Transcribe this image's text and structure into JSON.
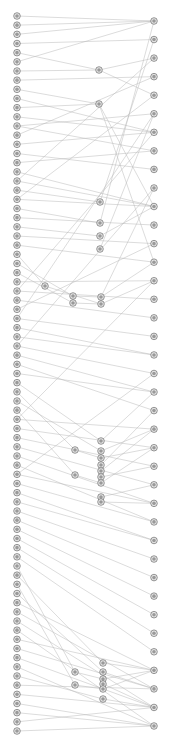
{
  "diagram": {
    "type": "layered-graph",
    "width": 172,
    "height": 753,
    "colors": {
      "edge": "#b8b8b8",
      "node_fill": "#e8e8e8",
      "node_stroke": "#555555",
      "node_core": "#9a9a9a"
    },
    "columns": {
      "left": {
        "x": 17,
        "y_start": 16,
        "y_end": 731,
        "count": 79
      },
      "right": {
        "x": 154,
        "y_start": 21,
        "y_end": 726,
        "count": 39
      }
    },
    "middle_nodes": [
      {
        "id": "m1",
        "x": 99,
        "y": 70
      },
      {
        "id": "m2",
        "x": 99,
        "y": 104
      },
      {
        "id": "m3",
        "x": 100,
        "y": 202
      },
      {
        "id": "m4",
        "x": 100,
        "y": 223
      },
      {
        "id": "m5",
        "x": 100,
        "y": 236
      },
      {
        "id": "m6",
        "x": 100,
        "y": 249
      },
      {
        "id": "m7",
        "x": 45,
        "y": 286
      },
      {
        "id": "m8",
        "x": 73,
        "y": 296
      },
      {
        "id": "m9",
        "x": 73,
        "y": 303
      },
      {
        "id": "m10",
        "x": 101,
        "y": 297
      },
      {
        "id": "m11",
        "x": 101,
        "y": 304
      },
      {
        "id": "m12",
        "x": 75,
        "y": 450
      },
      {
        "id": "m13",
        "x": 75,
        "y": 475
      },
      {
        "id": "m14",
        "x": 101,
        "y": 441
      },
      {
        "id": "m15",
        "x": 101,
        "y": 451
      },
      {
        "id": "m16",
        "x": 101,
        "y": 458
      },
      {
        "id": "m17",
        "x": 101,
        "y": 465
      },
      {
        "id": "m18",
        "x": 101,
        "y": 471
      },
      {
        "id": "m19",
        "x": 101,
        "y": 477
      },
      {
        "id": "m20",
        "x": 101,
        "y": 483
      },
      {
        "id": "m21",
        "x": 101,
        "y": 497
      },
      {
        "id": "m22",
        "x": 101,
        "y": 502
      },
      {
        "id": "m23",
        "x": 75,
        "y": 672
      },
      {
        "id": "m24",
        "x": 75,
        "y": 685
      },
      {
        "id": "m25",
        "x": 103,
        "y": 663
      },
      {
        "id": "m26",
        "x": 103,
        "y": 672
      },
      {
        "id": "m27",
        "x": 103,
        "y": 679
      },
      {
        "id": "m28",
        "x": 103,
        "y": 684
      },
      {
        "id": "m29",
        "x": 103,
        "y": 689
      },
      {
        "id": "m30",
        "x": 103,
        "y": 699
      }
    ],
    "edges": [
      [
        "L0",
        "R0"
      ],
      [
        "L1",
        "R0"
      ],
      [
        "L2",
        "R0"
      ],
      [
        "L3",
        "R1"
      ],
      [
        "L4",
        "m1"
      ],
      [
        "L5",
        "R0"
      ],
      [
        "L6",
        "m1"
      ],
      [
        "L7",
        "R3"
      ],
      [
        "L8",
        "m2"
      ],
      [
        "L9",
        "R6"
      ],
      [
        "L10",
        "m2"
      ],
      [
        "L11",
        "R6"
      ],
      [
        "L12",
        "R5"
      ],
      [
        "L13",
        "R3"
      ],
      [
        "L14",
        "R6"
      ],
      [
        "L15",
        "R8"
      ],
      [
        "L16",
        "R7"
      ],
      [
        "L17",
        "R10"
      ],
      [
        "L18",
        "R10"
      ],
      [
        "L19",
        "m3"
      ],
      [
        "L20",
        "R10"
      ],
      [
        "L21",
        "m4"
      ],
      [
        "L22",
        "R11"
      ],
      [
        "L23",
        "m5"
      ],
      [
        "L24",
        "R12"
      ],
      [
        "L25",
        "R13"
      ],
      [
        "L26",
        "m7"
      ],
      [
        "L27",
        "m8"
      ],
      [
        "L28",
        "m9"
      ],
      [
        "L29",
        "R14"
      ],
      [
        "L30",
        "R15"
      ],
      [
        "L31",
        "R16"
      ],
      [
        "L32",
        "R12"
      ],
      [
        "L33",
        "R17"
      ],
      [
        "L34",
        "R18"
      ],
      [
        "L35",
        "R18"
      ],
      [
        "L36",
        "R19"
      ],
      [
        "L37",
        "R20"
      ],
      [
        "L38",
        "R21"
      ],
      [
        "L39",
        "R20"
      ],
      [
        "L40",
        "m14"
      ],
      [
        "L41",
        "m12"
      ],
      [
        "L42",
        "m15"
      ],
      [
        "L43",
        "m13"
      ],
      [
        "L44",
        "R22"
      ],
      [
        "L45",
        "R23"
      ],
      [
        "L46",
        "R24"
      ],
      [
        "L47",
        "R25"
      ],
      [
        "L48",
        "R26"
      ],
      [
        "L49",
        "R27"
      ],
      [
        "L50",
        "R26"
      ],
      [
        "L51",
        "R27"
      ],
      [
        "L52",
        "R28"
      ],
      [
        "L53",
        "R28"
      ],
      [
        "L54",
        "R29"
      ],
      [
        "L55",
        "R30"
      ],
      [
        "L56",
        "R31"
      ],
      [
        "L57",
        "R32"
      ],
      [
        "L58",
        "R33"
      ],
      [
        "L59",
        "R34"
      ],
      [
        "L60",
        "m23"
      ],
      [
        "L61",
        "m25"
      ],
      [
        "L62",
        "m24"
      ],
      [
        "L63",
        "m26"
      ],
      [
        "L64",
        "R35"
      ],
      [
        "L65",
        "R36"
      ],
      [
        "L66",
        "R37"
      ],
      [
        "L67",
        "R38"
      ],
      [
        "L68",
        "R35"
      ],
      [
        "L69",
        "R36"
      ],
      [
        "L70",
        "R37"
      ],
      [
        "L71",
        "R38"
      ],
      [
        "L72",
        "m30"
      ],
      [
        "L73",
        "R36"
      ],
      [
        "L74",
        "R37"
      ],
      [
        "L75",
        "R38"
      ],
      [
        "L76",
        "R38"
      ],
      [
        "L77",
        "R37"
      ],
      [
        "L78",
        "R38"
      ],
      [
        "m1",
        "R2"
      ],
      [
        "m1",
        "R4"
      ],
      [
        "m2",
        "R10"
      ],
      [
        "m2",
        "R13"
      ],
      [
        "m3",
        "R1"
      ],
      [
        "m4",
        "R0"
      ],
      [
        "m5",
        "R10"
      ],
      [
        "m6",
        "R5"
      ],
      [
        "m7",
        "m11"
      ],
      [
        "m8",
        "m10"
      ],
      [
        "m9",
        "m11"
      ],
      [
        "m10",
        "R13"
      ],
      [
        "m11",
        "R14"
      ],
      [
        "m10",
        "R9"
      ],
      [
        "m12",
        "m16"
      ],
      [
        "m13",
        "m20"
      ],
      [
        "m14",
        "R20"
      ],
      [
        "m15",
        "R22"
      ],
      [
        "m16",
        "R23"
      ],
      [
        "m17",
        "R21"
      ],
      [
        "m18",
        "R22"
      ],
      [
        "m19",
        "R24"
      ],
      [
        "m20",
        "R23"
      ],
      [
        "m21",
        "R25"
      ],
      [
        "m22",
        "R26"
      ],
      [
        "m23",
        "m27"
      ],
      [
        "m24",
        "m29"
      ],
      [
        "m25",
        "R35"
      ],
      [
        "m26",
        "R36"
      ],
      [
        "m27",
        "R35"
      ],
      [
        "m28",
        "R37"
      ],
      [
        "m29",
        "R35"
      ],
      [
        "m30",
        "R37"
      ],
      [
        "L20",
        "R4"
      ],
      [
        "L12",
        "R7"
      ],
      [
        "L30",
        "R6"
      ],
      [
        "L33",
        "R5"
      ],
      [
        "L36",
        "R9"
      ],
      [
        "L44",
        "R14"
      ],
      [
        "L50",
        "R19"
      ],
      [
        "L18",
        "R2"
      ]
    ]
  }
}
